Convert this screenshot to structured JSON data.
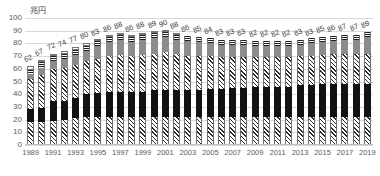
{
  "chart_data": {
    "type": "bar",
    "title": "",
    "unit_label": "兆円",
    "xlabel": "",
    "ylabel": "",
    "ylim": [
      0,
      100
    ],
    "ytick_step": 10,
    "yticks": [
      100,
      90,
      80,
      70,
      60,
      50,
      40,
      30,
      20,
      10,
      0
    ],
    "grid": true,
    "legend": "none",
    "stacked": true,
    "xtick_interval": 2,
    "categories": [
      "1989",
      "1990",
      "1991",
      "1992",
      "1993",
      "1994",
      "1995",
      "1996",
      "1997",
      "1998",
      "1999",
      "2000",
      "2001",
      "2002",
      "2003",
      "2004",
      "2005",
      "2006",
      "2007",
      "2008",
      "2009",
      "2010",
      "2011",
      "2012",
      "2013",
      "2014",
      "2015",
      "2016",
      "2017",
      "2018",
      "2019"
    ],
    "xtick_labels": [
      "1989",
      "1991",
      "1993",
      "1995",
      "1997",
      "1999",
      "2001",
      "2003",
      "2005",
      "2007",
      "2009",
      "2011",
      "2013",
      "2015",
      "2017",
      "2019"
    ],
    "totals": [
      62,
      67,
      72,
      74,
      77,
      80,
      83,
      86,
      88,
      86,
      88,
      89,
      90,
      88,
      86,
      85,
      84,
      83,
      83,
      83,
      82,
      82,
      82,
      82,
      83,
      83,
      85,
      86,
      87,
      87,
      89
    ],
    "series": [
      {
        "name": "segment-1-hatch-lower",
        "pattern": "diagonal-hatch",
        "values": [
          18,
          18,
          19,
          20,
          21,
          22,
          22,
          22,
          22,
          22,
          22,
          22,
          22,
          22,
          22,
          22,
          22,
          22,
          22,
          22,
          22,
          22,
          22,
          22,
          22,
          22,
          22,
          22,
          22,
          22,
          22
        ]
      },
      {
        "name": "segment-2-black",
        "pattern": "solid-black",
        "values": [
          10,
          11,
          16,
          15,
          16,
          18,
          19,
          20,
          20,
          20,
          20,
          21,
          21,
          21,
          21,
          21,
          22,
          22,
          23,
          23,
          24,
          24,
          24,
          24,
          25,
          25,
          26,
          26,
          26,
          26,
          26
        ]
      },
      {
        "name": "segment-3-hatch-upper",
        "pattern": "diagonal-hatch",
        "values": [
          24,
          26,
          25,
          26,
          26,
          26,
          27,
          28,
          29,
          28,
          29,
          29,
          30,
          29,
          27,
          27,
          26,
          25,
          24,
          24,
          23,
          23,
          23,
          23,
          23,
          23,
          23,
          24,
          24,
          24,
          24
        ]
      },
      {
        "name": "segment-4-gray",
        "pattern": "solid-gray",
        "values": [
          4,
          6,
          6,
          7,
          8,
          8,
          10,
          11,
          12,
          11,
          12,
          12,
          12,
          11,
          12,
          11,
          10,
          10,
          10,
          10,
          9,
          9,
          9,
          9,
          9,
          10,
          10,
          10,
          11,
          11,
          13
        ]
      },
      {
        "name": "segment-5-horizontal-stripe",
        "pattern": "horizontal-stripe",
        "values": [
          3,
          4,
          4,
          4,
          4,
          4,
          4,
          4,
          4,
          4,
          4,
          4,
          4,
          4,
          4,
          4,
          4,
          4,
          4,
          4,
          4,
          4,
          4,
          4,
          4,
          4,
          4,
          4,
          4,
          4,
          4
        ]
      },
      {
        "name": "segment-6-white",
        "pattern": "white-outline",
        "values": [
          3,
          2,
          2,
          2,
          2,
          2,
          1,
          1,
          1,
          1,
          1,
          1,
          1,
          1,
          0,
          0,
          0,
          0,
          0,
          0,
          0,
          0,
          0,
          0,
          0,
          0,
          0,
          0,
          0,
          0,
          0
        ]
      }
    ],
    "colors": {
      "hatch": "#ffffff",
      "black": "#121212",
      "gray": "#8c8c8c",
      "stripe": "#ffffff",
      "white": "#ffffff",
      "gridline": "#d9d9d9",
      "text": "#3f3f3f"
    }
  }
}
